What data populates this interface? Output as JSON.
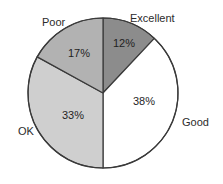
{
  "chart_data": {
    "type": "pie",
    "title": "",
    "subtitle": "",
    "xlabel": "",
    "ylabel": "",
    "legend_position": "outside-labels",
    "grid": false,
    "start_angle_deg": 0,
    "direction": "clockwise",
    "categories": [
      "Excellent",
      "Good",
      "OK",
      "Poor"
    ],
    "values": [
      12,
      38,
      33,
      17
    ],
    "value_labels": [
      "12%",
      "38%",
      "33%",
      "17%"
    ],
    "units": "percent",
    "colors": [
      "#8c8c8c",
      "#ffffff",
      "#cfcfcf",
      "#b2b2b2"
    ],
    "slices": [
      {
        "name": "Excellent",
        "value": 12,
        "value_label": "12%",
        "color": "#8c8c8c",
        "start_deg": 0,
        "end_deg": 43.2
      },
      {
        "name": "Good",
        "value": 38,
        "value_label": "38%",
        "color": "#ffffff",
        "start_deg": 43.2,
        "end_deg": 180.0
      },
      {
        "name": "OK",
        "value": 33,
        "value_label": "33%",
        "color": "#cfcfcf",
        "start_deg": 180.0,
        "end_deg": 298.8
      },
      {
        "name": "Poor",
        "value": 17,
        "value_label": "17%",
        "color": "#b2b2b2",
        "start_deg": 298.8,
        "end_deg": 360.0
      }
    ],
    "stroke_color": "#3a3a3a",
    "background_color": "#ffffff"
  },
  "labels": {
    "excellent": "Excellent",
    "good": "Good",
    "ok": "OK",
    "poor": "Poor"
  },
  "values": {
    "excellent": "12%",
    "good": "38%",
    "ok": "33%",
    "poor": "17%"
  }
}
